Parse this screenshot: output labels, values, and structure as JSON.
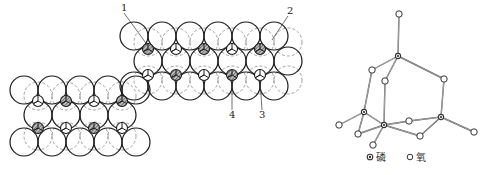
{
  "left_figure": {
    "description": "Close-packed sphere layers with tetrahedral and octahedral voids",
    "labels": [
      {
        "id": "1",
        "text": "1",
        "x": 124,
        "y": 11
      },
      {
        "id": "2",
        "text": "2",
        "x": 290,
        "y": 14
      },
      {
        "id": "3",
        "text": "3",
        "x": 262,
        "y": 118
      },
      {
        "id": "4",
        "text": "4",
        "x": 232,
        "y": 118
      }
    ],
    "upper_lattice": {
      "top_row_y": 36,
      "mid_row_y": 61,
      "bottom_row_y": 86,
      "top_row_x": [
        134,
        162,
        190,
        218,
        246,
        274
      ],
      "mid_row_x": [
        148,
        176,
        204,
        232,
        260,
        288
      ],
      "bottom_row_x": [
        134,
        162,
        190,
        218,
        246,
        274
      ],
      "upper_voids": [
        {
          "x": 148,
          "y": 49,
          "type": "shaded"
        },
        {
          "x": 176,
          "y": 49,
          "type": "open"
        },
        {
          "x": 204,
          "y": 49,
          "type": "shaded"
        },
        {
          "x": 232,
          "y": 49,
          "type": "open"
        },
        {
          "x": 260,
          "y": 49,
          "type": "shaded"
        }
      ],
      "lower_voids": [
        {
          "x": 148,
          "y": 75,
          "type": "open"
        },
        {
          "x": 176,
          "y": 75,
          "type": "shaded"
        },
        {
          "x": 204,
          "y": 75,
          "type": "open"
        },
        {
          "x": 232,
          "y": 75,
          "type": "shaded"
        },
        {
          "x": 260,
          "y": 75,
          "type": "open"
        }
      ]
    },
    "lower_lattice": {
      "top_row_y": 90,
      "mid_row_y": 115,
      "bottom_row_y": 142,
      "top_row_x": [
        24,
        52,
        80,
        108,
        136
      ],
      "mid_row_x": [
        38,
        66,
        94,
        122
      ],
      "bottom_row_x": [
        24,
        52,
        80,
        108,
        136
      ],
      "upper_voids": [
        {
          "x": 38,
          "y": 101,
          "type": "open"
        },
        {
          "x": 66,
          "y": 101,
          "type": "shaded"
        },
        {
          "x": 94,
          "y": 101,
          "type": "open"
        },
        {
          "x": 122,
          "y": 101,
          "type": "shaded"
        }
      ],
      "lower_voids": [
        {
          "x": 38,
          "y": 128,
          "type": "shaded"
        },
        {
          "x": 66,
          "y": 128,
          "type": "open"
        },
        {
          "x": 94,
          "y": 128,
          "type": "shaded"
        },
        {
          "x": 122,
          "y": 128,
          "type": "open"
        }
      ]
    }
  },
  "right_figure": {
    "description": "P4O10 / P4O6 cage molecular structure",
    "legend": [
      {
        "symbol": "phosphorus-marker",
        "label": "磷"
      },
      {
        "symbol": "oxygen-marker",
        "label": "氧"
      }
    ],
    "atoms": [
      {
        "id": "O_top",
        "type": "O",
        "x": 399,
        "y": 14
      },
      {
        "id": "P1",
        "type": "P",
        "x": 398,
        "y": 56
      },
      {
        "id": "O_a",
        "type": "O",
        "x": 372,
        "y": 70
      },
      {
        "id": "O_b",
        "type": "O",
        "x": 385,
        "y": 81
      },
      {
        "id": "O_c",
        "type": "O",
        "x": 444,
        "y": 79
      },
      {
        "id": "P2",
        "type": "P",
        "x": 364,
        "y": 112
      },
      {
        "id": "P3",
        "type": "P",
        "x": 384,
        "y": 125
      },
      {
        "id": "P4",
        "type": "P",
        "x": 441,
        "y": 117
      },
      {
        "id": "O_d",
        "type": "O",
        "x": 409,
        "y": 121
      },
      {
        "id": "O_e",
        "type": "O",
        "x": 339,
        "y": 125
      },
      {
        "id": "O_f",
        "type": "O",
        "x": 358,
        "y": 134
      },
      {
        "id": "O_g",
        "type": "O",
        "x": 420,
        "y": 136
      },
      {
        "id": "O_h",
        "type": "O",
        "x": 373,
        "y": 145
      },
      {
        "id": "O_i",
        "type": "O",
        "x": 474,
        "y": 132
      }
    ],
    "bonds": [
      [
        "O_top",
        "P1"
      ],
      [
        "P1",
        "O_a"
      ],
      [
        "P1",
        "O_b"
      ],
      [
        "P1",
        "O_c"
      ],
      [
        "O_a",
        "P2"
      ],
      [
        "O_b",
        "P3"
      ],
      [
        "O_c",
        "P4"
      ],
      [
        "P2",
        "O_e"
      ],
      [
        "P2",
        "O_f"
      ],
      [
        "P2",
        "P3"
      ],
      [
        "P3",
        "O_f"
      ],
      [
        "P3",
        "O_d"
      ],
      [
        "P3",
        "O_g"
      ],
      [
        "P3",
        "O_h"
      ],
      [
        "O_d",
        "P4"
      ],
      [
        "O_g",
        "P4"
      ],
      [
        "P4",
        "O_i"
      ]
    ]
  }
}
